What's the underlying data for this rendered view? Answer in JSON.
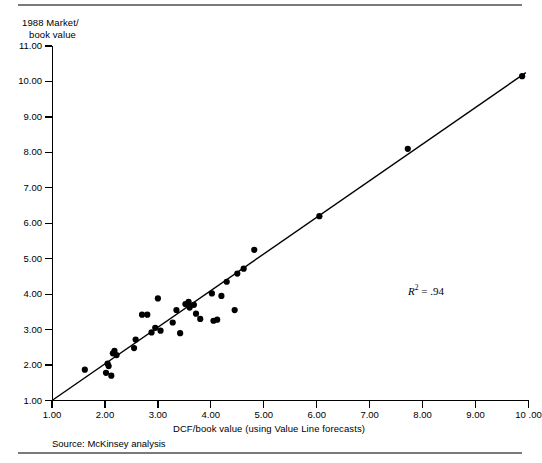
{
  "exhibit": {
    "source_note": "Source: McKinsey analysis",
    "annotation": {
      "symbol": "R",
      "exponent": "2",
      "equals": " = .94",
      "full": "R2 = .94"
    }
  },
  "chart_data": {
    "type": "scatter",
    "title": "",
    "ylabel": "1988 Market/\nbook value",
    "ylabel_line1": "1988 Market/",
    "ylabel_line2": "book value",
    "xlabel": "DCF/book value (using Value Line forecasts)",
    "xlim": [
      1.0,
      10.0
    ],
    "ylim": [
      1.0,
      11.0
    ],
    "grid": false,
    "legend": false,
    "r_squared": 0.94,
    "x_ticks": [
      1.0,
      2.0,
      3.0,
      4.0,
      5.0,
      6.0,
      7.0,
      8.0,
      9.0,
      10.0
    ],
    "x_tick_labels": [
      "1.00",
      "2.00",
      "3.00",
      "4.00",
      "5.00",
      "6.00",
      "7.00",
      "8.00",
      "9.00",
      "10 .00"
    ],
    "y_ticks": [
      1.0,
      2.0,
      3.0,
      4.0,
      5.0,
      6.0,
      7.0,
      8.0,
      9.0,
      10.0,
      11.0
    ],
    "y_tick_labels": [
      "1.00",
      "2.00",
      "3.00",
      "4.00",
      "5.00",
      "6.00",
      "7.00",
      "8.00",
      "9.00",
      "10.00",
      "11.00"
    ],
    "trendline": {
      "x": [
        1.0,
        9.95
      ],
      "y": [
        1.0,
        10.25
      ]
    },
    "points": [
      {
        "x": 1.62,
        "y": 1.87
      },
      {
        "x": 2.02,
        "y": 1.78
      },
      {
        "x": 2.05,
        "y": 2.04
      },
      {
        "x": 2.07,
        "y": 1.97
      },
      {
        "x": 2.12,
        "y": 1.7
      },
      {
        "x": 2.15,
        "y": 2.33
      },
      {
        "x": 2.18,
        "y": 2.4
      },
      {
        "x": 2.22,
        "y": 2.28
      },
      {
        "x": 2.55,
        "y": 2.48
      },
      {
        "x": 2.58,
        "y": 2.72
      },
      {
        "x": 2.7,
        "y": 3.42
      },
      {
        "x": 2.8,
        "y": 3.42
      },
      {
        "x": 2.88,
        "y": 2.92
      },
      {
        "x": 2.95,
        "y": 3.05
      },
      {
        "x": 3.0,
        "y": 3.88
      },
      {
        "x": 3.05,
        "y": 2.97
      },
      {
        "x": 3.28,
        "y": 3.2
      },
      {
        "x": 3.35,
        "y": 3.55
      },
      {
        "x": 3.42,
        "y": 2.9
      },
      {
        "x": 3.52,
        "y": 3.72
      },
      {
        "x": 3.58,
        "y": 3.78
      },
      {
        "x": 3.6,
        "y": 3.62
      },
      {
        "x": 3.68,
        "y": 3.7
      },
      {
        "x": 3.72,
        "y": 3.45
      },
      {
        "x": 3.8,
        "y": 3.3
      },
      {
        "x": 4.02,
        "y": 4.02
      },
      {
        "x": 4.05,
        "y": 3.25
      },
      {
        "x": 4.12,
        "y": 3.28
      },
      {
        "x": 4.2,
        "y": 3.95
      },
      {
        "x": 4.3,
        "y": 4.35
      },
      {
        "x": 4.45,
        "y": 3.55
      },
      {
        "x": 4.5,
        "y": 4.58
      },
      {
        "x": 4.62,
        "y": 4.72
      },
      {
        "x": 4.82,
        "y": 5.25
      },
      {
        "x": 6.05,
        "y": 6.2
      },
      {
        "x": 7.72,
        "y": 8.1
      },
      {
        "x": 9.88,
        "y": 10.15
      }
    ]
  }
}
